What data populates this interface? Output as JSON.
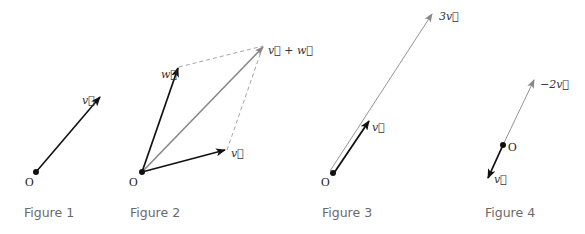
{
  "figures": [
    {
      "caption": "Figure 1",
      "origin_label": "O",
      "vectors": [
        {
          "label": "v⃗",
          "description": "vector v from origin"
        }
      ]
    },
    {
      "caption": "Figure 2",
      "origin_label": "O",
      "vectors": [
        {
          "label": "w⃗",
          "description": "vector w from origin"
        },
        {
          "label": "v⃗",
          "description": "vector v from origin"
        },
        {
          "label": "v⃗ + w⃗",
          "description": "sum vector, parallelogram diagonal"
        }
      ]
    },
    {
      "caption": "Figure 3",
      "origin_label": "O",
      "vectors": [
        {
          "label": "v⃗",
          "description": "vector v"
        },
        {
          "label": "3v⃗",
          "description": "scaled vector 3v"
        }
      ]
    },
    {
      "caption": "Figure 4",
      "origin_label": "O",
      "vectors": [
        {
          "label": "v⃗",
          "description": "vector v (pointing down-left)"
        },
        {
          "label": "−2v⃗",
          "description": "scaled vector -2v"
        }
      ]
    }
  ],
  "colors": {
    "strong": "#111111",
    "light": "#888888",
    "dashed": "#999999",
    "caption": "#6a6a6a"
  }
}
